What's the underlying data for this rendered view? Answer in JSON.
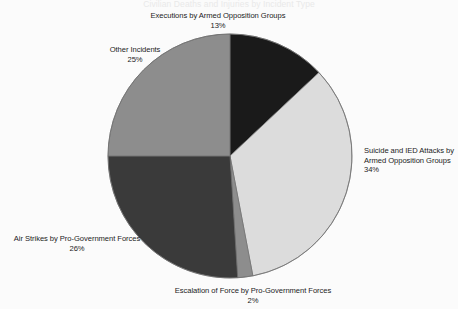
{
  "page": {
    "background_color": "#fbfbfb",
    "clipped_header_text": "Civilian Deaths and Injuries by Incident Type"
  },
  "chart_data": {
    "type": "pie",
    "title": "",
    "xlabel": "",
    "ylabel": "",
    "legend_position": "none",
    "grid": false,
    "units": "percent",
    "start_angle_deg": 0,
    "direction": "clockwise",
    "center": {
      "x": 230,
      "y": 156
    },
    "radius": 122,
    "categories": [
      "Executions by Armed Opposition Groups",
      "Suicide and IED Attacks by Armed Opposition Groups",
      "Escalation of Force by Pro-Government Forces",
      "Air Strikes by Pro-Government Forces",
      "Other Incidents"
    ],
    "values": [
      13,
      34,
      2,
      26,
      25
    ],
    "colors": [
      "#1a1a1a",
      "#dcdcdc",
      "#8d8d8d",
      "#3a3a3a",
      "#8d8d8d"
    ],
    "slices": [
      {
        "name": "Executions by Armed Opposition Groups",
        "label_line1": "Executions by Armed Opposition Groups",
        "label_line2": "",
        "value": 13,
        "value_label": "13%",
        "color": "#1a1a1a",
        "start_deg": 0,
        "end_deg": 46.8
      },
      {
        "name": "Suicide and IED Attacks by Armed Opposition Groups",
        "label_line1": "Suicide and IED Attacks by",
        "label_line2": "Armed Opposition Groups",
        "value": 34,
        "value_label": "34%",
        "color": "#dcdcdc",
        "start_deg": 46.8,
        "end_deg": 169.2
      },
      {
        "name": "Escalation of Force by Pro-Government Forces",
        "label_line1": "Escalation of Force by Pro-Government Forces",
        "label_line2": "",
        "value": 2,
        "value_label": "2%",
        "color": "#8d8d8d",
        "start_deg": 169.2,
        "end_deg": 176.4
      },
      {
        "name": "Air Strikes by Pro-Government Forces",
        "label_line1": "Air Strikes by Pro-Government Forces",
        "label_line2": "",
        "value": 26,
        "value_label": "26%",
        "color": "#3a3a3a",
        "start_deg": 176.4,
        "end_deg": 270
      },
      {
        "name": "Other Incidents",
        "label_line1": "Other Incidents",
        "label_line2": "",
        "value": 25,
        "value_label": "25%",
        "color": "#8d8d8d",
        "start_deg": 270,
        "end_deg": 360
      }
    ],
    "stroke_color": "#6e6e6e",
    "stroke_width": 0.7
  }
}
